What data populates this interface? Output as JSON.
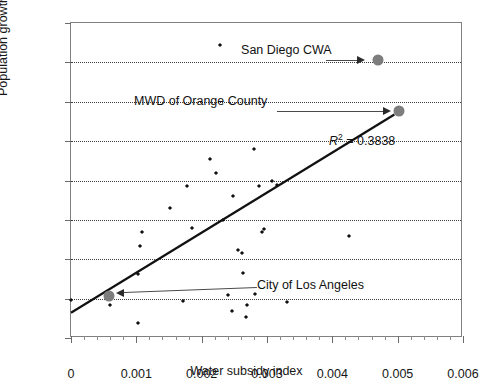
{
  "chart_data": {
    "type": "scatter",
    "title": "",
    "xlabel": "Water subsidy index",
    "ylabel": "Population growth rate",
    "xlim": [
      0,
      0.006
    ],
    "ylim": [
      0,
      0.16
    ],
    "xticks": [
      "0",
      "0.001",
      "0.002",
      "0.003",
      "0.004",
      "0.005",
      "0.006"
    ],
    "xtick_values": [
      0,
      0.001,
      0.002,
      0.003,
      0.004,
      0.005,
      0.006
    ],
    "yticks": [
      "0",
      "0.02",
      "0.04",
      "0.06",
      "0.08",
      "0.1",
      "0.12",
      "0.14",
      "0.16"
    ],
    "ytick_values": [
      0,
      0.02,
      0.04,
      0.06,
      0.08,
      0.1,
      0.12,
      0.14,
      0.16
    ],
    "grid": "horizontal-dotted",
    "legend": "none",
    "r_squared": 0.3838,
    "r_squared_label": "R² = 0.3838",
    "trendline": {
      "type": "linear",
      "x_start": 0.0,
      "y_start": 0.0128,
      "x_end": 0.00495,
      "y_end": 0.1135
    },
    "points": [
      {
        "x": 0.0,
        "y": 0.0192
      },
      {
        "x": 0.0006,
        "y": 0.0166
      },
      {
        "x": 0.00103,
        "y": 0.0078
      },
      {
        "x": 0.00103,
        "y": 0.0325
      },
      {
        "x": 0.00108,
        "y": 0.054
      },
      {
        "x": 0.00106,
        "y": 0.0468
      },
      {
        "x": 0.00152,
        "y": 0.0662
      },
      {
        "x": 0.00172,
        "y": 0.0187
      },
      {
        "x": 0.00177,
        "y": 0.077
      },
      {
        "x": 0.00185,
        "y": 0.056
      },
      {
        "x": 0.00212,
        "y": 0.091
      },
      {
        "x": 0.00222,
        "y": 0.084
      },
      {
        "x": 0.00228,
        "y": 0.149
      },
      {
        "x": 0.00232,
        "y": 0.06
      },
      {
        "x": 0.0024,
        "y": 0.0218
      },
      {
        "x": 0.00247,
        "y": 0.0135
      },
      {
        "x": 0.00248,
        "y": 0.072
      },
      {
        "x": 0.00256,
        "y": 0.0448
      },
      {
        "x": 0.00262,
        "y": 0.0432
      },
      {
        "x": 0.00263,
        "y": 0.0332
      },
      {
        "x": 0.00268,
        "y": 0.0108
      },
      {
        "x": 0.0027,
        "y": 0.017
      },
      {
        "x": 0.0028,
        "y": 0.096
      },
      {
        "x": 0.00282,
        "y": 0.0222
      },
      {
        "x": 0.00287,
        "y": 0.0772
      },
      {
        "x": 0.00292,
        "y": 0.054
      },
      {
        "x": 0.00296,
        "y": 0.0556
      },
      {
        "x": 0.00307,
        "y": 0.08
      },
      {
        "x": 0.00316,
        "y": 0.0776
      },
      {
        "x": 0.0033,
        "y": 0.0185
      },
      {
        "x": 0.00425,
        "y": 0.0518
      }
    ],
    "highlighted_points": [
      {
        "label": "San Diego CWA",
        "x": 0.0047,
        "y": 0.1412
      },
      {
        "label": "MWD of Orange County",
        "x": 0.00502,
        "y": 0.1152
      },
      {
        "label": "City of Los Angeles",
        "x": 0.00058,
        "y": 0.0215
      }
    ],
    "annotations": [
      {
        "name": "san-diego-cwa",
        "text": "San Diego CWA"
      },
      {
        "name": "mwd-orange-county",
        "text": "MWD of Orange County"
      },
      {
        "name": "city-of-los-angeles",
        "text": "City of Los Angeles"
      }
    ]
  }
}
